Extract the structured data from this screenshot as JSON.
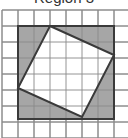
{
  "title": "Region 3",
  "colors": {
    "background": "#ffffff",
    "grid_line": "#8a8a8a",
    "shaded_region": "#a6a6a6",
    "inner_square_fill": "#ffffff",
    "outline": "#3a3a3a"
  },
  "grid": {
    "columns": 8,
    "rows": 8,
    "cell_size_px": 16,
    "origin_x": 2,
    "origin_y": 10
  },
  "outer_square": {
    "x": 18,
    "y": 26,
    "width": 96,
    "height": 93
  },
  "inner_square": {
    "vertices": [
      [
        50,
        26
      ],
      [
        114,
        55
      ],
      [
        82,
        117
      ],
      [
        18,
        88
      ]
    ]
  }
}
